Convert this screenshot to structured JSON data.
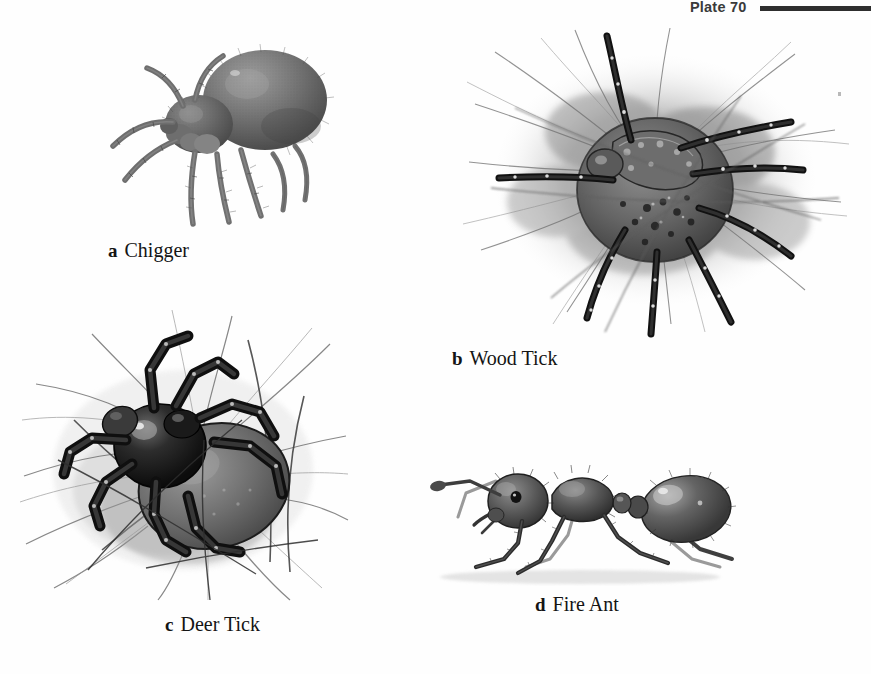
{
  "page": {
    "background_color": "#fefefe",
    "ink_color": "#141414",
    "running_head": {
      "plate_label": "Plate 70",
      "rule_color": "#2e2e2e"
    }
  },
  "figures": [
    {
      "id": "chigger",
      "letter": "a",
      "name": "Chigger",
      "subject": "chigger mite",
      "style": "grayscale stipple engraving",
      "description": "Enlarged chigger mite in three-quarter view with bulbous rounded abdomen, small gnathosoma and eight long hairy legs",
      "palette": {
        "body": "#6f6f6f",
        "shade": "#4a4a4a",
        "highlight": "#bdbdbd"
      }
    },
    {
      "id": "woodtick",
      "letter": "b",
      "name": "Wood Tick",
      "subject": "wood tick (dog tick)",
      "style": "grayscale wash with ink line",
      "description": "Dorsal view of a wood tick with mottled scutum sitting on a dense field of body hairs, legs banded dark with pale spots",
      "palette": {
        "body": "#5c5c5c",
        "legs": "#1e1e1e",
        "hair": "#8d8d8d",
        "wash": "#9a9a9a"
      }
    },
    {
      "id": "deertick",
      "letter": "c",
      "name": "Deer Tick",
      "subject": "deer tick (blacklegged tick)",
      "style": "grayscale wash with ink line",
      "description": "Deer tick with glossy black scutum and swollen gray abdomen, gripping coarse hairs on skin",
      "palette": {
        "scutum": "#141414",
        "abdomen": "#757575",
        "hair": "#3a3a3a",
        "highlight": "#e8e8e8"
      }
    },
    {
      "id": "fireant",
      "letter": "d",
      "name": "Fire Ant",
      "subject": "fire ant worker",
      "style": "grayscale pencil rendering",
      "description": "Lateral profile of a fire ant worker showing head with mandibles and eye, elbowed antenna, thorax, two-node petiole and rounded gaster, standing on six legs",
      "palette": {
        "body": "#4e4e4e",
        "shade": "#2b2b2b",
        "highlight": "#cfcfcf"
      }
    }
  ]
}
